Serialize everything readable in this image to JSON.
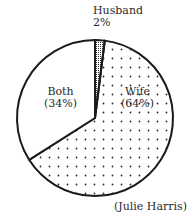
{
  "chart_data": {
    "type": "pie",
    "title": "",
    "categories": [
      "Husband",
      "Wife",
      "Both"
    ],
    "values": [
      2,
      64,
      34
    ],
    "unit": "%",
    "slices": [
      {
        "name": "Husband",
        "value": 2,
        "label": "Husband",
        "value_label": "2%",
        "fill": "crosshatch"
      },
      {
        "name": "Wife",
        "value": 64,
        "label": "Wife",
        "value_label": "(64%)",
        "fill": "dotted"
      },
      {
        "name": "Both",
        "value": 34,
        "label": "Both",
        "value_label": "(34%)",
        "fill": "white"
      }
    ],
    "start_angle_deg": 0,
    "direction": "clockwise",
    "legend": "none",
    "credit": "(Julie Harris)"
  },
  "labels": {
    "husband_name": "Husband",
    "husband_value": "2%",
    "both_name": "Both",
    "both_value": "(34%)",
    "wife_name": "Wife",
    "wife_value": "(64%)"
  },
  "credit": "(Julie Harris)",
  "colors": {
    "outline": "#1a1a1a",
    "dots": "#2a2a2a",
    "background": "#ffffff"
  }
}
